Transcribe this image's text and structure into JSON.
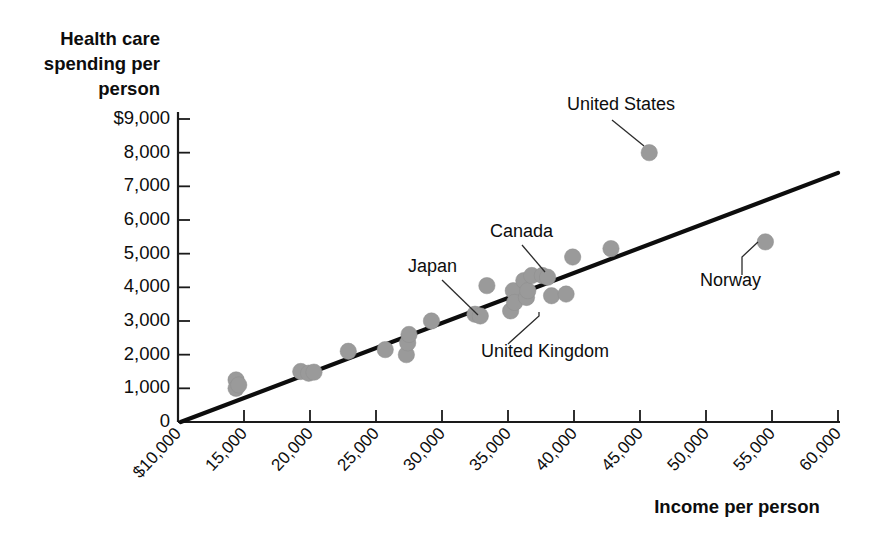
{
  "chart_data": {
    "type": "scatter",
    "title": "",
    "xlabel": "Income per person",
    "ylabel": "Health care spending per person",
    "ylabel_lines": [
      "Health care",
      "spending per",
      "person"
    ],
    "xlim": [
      10000,
      60000
    ],
    "ylim": [
      0,
      9000
    ],
    "grid": false,
    "legend": "none",
    "x_ticks": [
      {
        "value": 10000,
        "label": "$10,000"
      },
      {
        "value": 15000,
        "label": "15,000"
      },
      {
        "value": 20000,
        "label": "20,000"
      },
      {
        "value": 25000,
        "label": "25,000"
      },
      {
        "value": 30000,
        "label": "30,000"
      },
      {
        "value": 35000,
        "label": "35,000"
      },
      {
        "value": 40000,
        "label": "40,000"
      },
      {
        "value": 45000,
        "label": "45,000"
      },
      {
        "value": 50000,
        "label": "50,000"
      },
      {
        "value": 55000,
        "label": "55,000"
      },
      {
        "value": 60000,
        "label": "60,000"
      }
    ],
    "y_ticks": [
      {
        "value": 9000,
        "label": "$9,000"
      },
      {
        "value": 8000,
        "label": "8,000"
      },
      {
        "value": 7000,
        "label": "7,000"
      },
      {
        "value": 6000,
        "label": "6,000"
      },
      {
        "value": 5000,
        "label": "5,000"
      },
      {
        "value": 4000,
        "label": "4,000"
      },
      {
        "value": 3000,
        "label": "3,000"
      },
      {
        "value": 2000,
        "label": "2,000"
      },
      {
        "value": 1000,
        "label": "1,000"
      },
      {
        "value": 0,
        "label": "0"
      }
    ],
    "points": [
      {
        "x": 14400,
        "y": 1250
      },
      {
        "x": 14400,
        "y": 1000
      },
      {
        "x": 14600,
        "y": 1100
      },
      {
        "x": 19300,
        "y": 1500
      },
      {
        "x": 19900,
        "y": 1450
      },
      {
        "x": 20300,
        "y": 1480
      },
      {
        "x": 22900,
        "y": 2100
      },
      {
        "x": 25700,
        "y": 2150
      },
      {
        "x": 27300,
        "y": 2000
      },
      {
        "x": 27400,
        "y": 2350
      },
      {
        "x": 27500,
        "y": 2600
      },
      {
        "x": 29200,
        "y": 3000
      },
      {
        "x": 32500,
        "y": 3200
      },
      {
        "x": 32900,
        "y": 3150
      },
      {
        "x": 33400,
        "y": 4050
      },
      {
        "x": 35200,
        "y": 3300
      },
      {
        "x": 35400,
        "y": 3900
      },
      {
        "x": 35500,
        "y": 3550
      },
      {
        "x": 36200,
        "y": 4200
      },
      {
        "x": 36400,
        "y": 3700
      },
      {
        "x": 36500,
        "y": 3900
      },
      {
        "x": 36800,
        "y": 4350
      },
      {
        "x": 37600,
        "y": 4350
      },
      {
        "x": 38000,
        "y": 4300
      },
      {
        "x": 38300,
        "y": 3750
      },
      {
        "x": 39400,
        "y": 3800
      },
      {
        "x": 39900,
        "y": 4900
      },
      {
        "x": 42800,
        "y": 5150
      },
      {
        "x": 45700,
        "y": 8000
      },
      {
        "x": 54500,
        "y": 5350
      }
    ],
    "trend_line": {
      "x1": 10200,
      "y1": 0,
      "x2": 60000,
      "y2": 7400
    },
    "annotations": [
      {
        "label": "United States",
        "label_x": 567,
        "label_y": 110,
        "leader": {
          "x1": 612,
          "y1": 120,
          "x2": 644,
          "y2": 146
        }
      },
      {
        "label": "Canada",
        "label_x": 490,
        "label_y": 237,
        "leader": {
          "x1": 522,
          "y1": 245,
          "x2": 545,
          "y2": 272
        }
      },
      {
        "label": "Japan",
        "label_x": 408,
        "label_y": 272,
        "leader": {
          "x1": 442,
          "y1": 280,
          "x2": 478,
          "y2": 315
        }
      },
      {
        "label": "United Kingdom",
        "label_x": 481,
        "label_y": 357,
        "leader_path": "M 508 344 L 539 316 L 539 312"
      },
      {
        "label": "Norway",
        "label_x": 700,
        "label_y": 286,
        "leader_path": "M 742 275 L 742 257 L 758 242"
      }
    ]
  }
}
